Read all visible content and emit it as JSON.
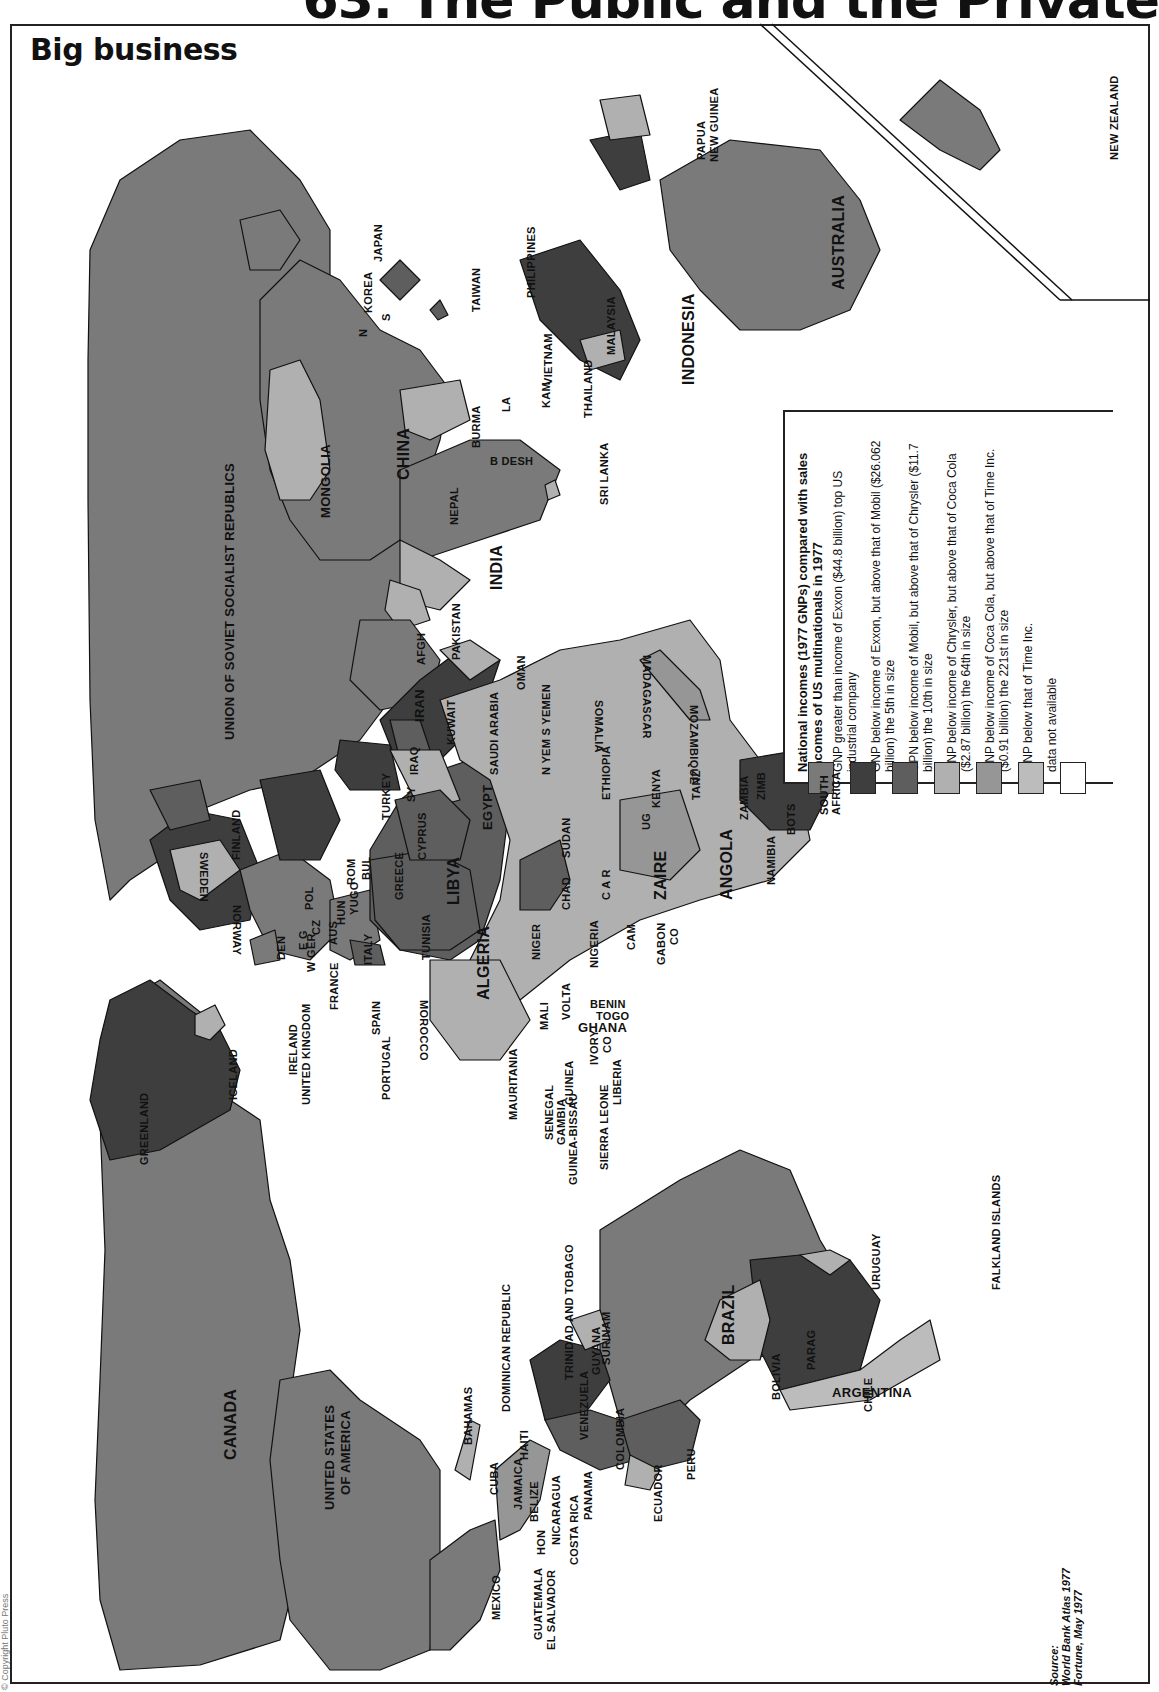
{
  "page": {
    "header_title": "63. The Public and the Private",
    "copyright": "© Copyright Pluto Press"
  },
  "map": {
    "title": "Big business",
    "orientation": "rotated 90° clockwise",
    "colors": {
      "cat1_above_exxon": "#7a7a7a",
      "cat2_exxon_mobil": "#3e3e3e",
      "cat3_mobil_chrysler": "#5e5e5e",
      "cat4_chrysler_cocacola": "#b0b0b0",
      "cat5_cocacola_time": "#969696",
      "cat6_below_time": "#bcbcbc",
      "cat7_no_data": "#ffffff",
      "sea": "#ffffff",
      "border": "#111111"
    }
  },
  "legend": {
    "title": "National incomes (1977 GNPs) compared with sales incomes of US multinationals in 1977",
    "items": [
      {
        "label": "GNP greater than income of Exxon ($44.8 billion) top US industrial company",
        "color": "#7a7a7a"
      },
      {
        "label": "GNP below income of Exxon, but above that of Mobil ($26.062 billion) the 5th in size",
        "color": "#3e3e3e"
      },
      {
        "label": "GPN below income of Mobil, but above that of Chrysler ($11.7 billion) the 10th in size",
        "color": "#5e5e5e"
      },
      {
        "label": "GNP below income of Chrysler, but above that of Coca Cola ($2.87 billion) the 64th in size",
        "color": "#b0b0b0"
      },
      {
        "label": "GNP below income of Coca Cola, but above that of Time Inc. ($0.91 billion) the 221st in size",
        "color": "#969696"
      },
      {
        "label": "GNP below that of Time Inc.",
        "color": "#bcbcbc"
      },
      {
        "label": "data not available",
        "color": "#ffffff"
      }
    ]
  },
  "source": {
    "label": "Source:",
    "lines": [
      "World Bank Atlas 1977",
      "Fortune, May 1977"
    ]
  },
  "labels": {
    "canada": "CANADA",
    "usa1": "UNITED STATES",
    "usa2": "OF AMERICA",
    "mexico": "MEXICO",
    "guatemala": "GUATEMALA",
    "el_salvador": "EL SALVADOR",
    "hon": "HON",
    "belize": "BELIZE",
    "nicaragua": "NICARAGUA",
    "costa_rica": "COSTA RICA",
    "panama": "PANAMA",
    "cuba": "CUBA",
    "jamaica": "JAMAICA",
    "haiti": "HAITI",
    "bahamas": "BAHAMAS",
    "dominican_republic": "DOMINICAN REPUBLIC",
    "trinidad": "TRINIDAD AND TOBAGO",
    "venezuela": "VENEZUELA",
    "colombia": "COLOMBIA",
    "ecuador": "ECUADOR",
    "peru": "PERU",
    "guyana": "GUYANA",
    "surinam": "SURINAM",
    "brazil": "BRAZIL",
    "bolivia": "BOLIVIA",
    "parag": "PARAG",
    "chile": "CHILE",
    "argentina": "ARGENTINA",
    "uruguay": "URUGUAY",
    "falklands": "FALKLAND ISLANDS",
    "greenland": "GREENLAND",
    "iceland": "ICELAND",
    "ireland": "IRELAND",
    "uk": "UNITED KINGDOM",
    "portugal": "PORTUGAL",
    "spain": "SPAIN",
    "france": "FRANCE",
    "italy": "ITALY",
    "w_ger": "W GER",
    "e_ger": "E G",
    "cz": "CZ",
    "aus": "AUS",
    "hun": "HUN",
    "yugo": "YUGO",
    "rom": "ROM",
    "bul": "BUL",
    "pol": "POL",
    "norway": "NORWAY",
    "sweden": "SWEDEN",
    "finland": "FINLAND",
    "den": "DEN",
    "greece": "GREECE",
    "turkey": "TURKEY",
    "cyprus": "CYPRUS",
    "sy": "SY",
    "ussr": "UNION OF SOVIET SOCIALIST REPUBLICS",
    "mongolia": "MONGOLIA",
    "china": "CHINA",
    "korea": "KOREA",
    "korea_n": "N",
    "korea_s": "S",
    "japan": "JAPAN",
    "taiwan": "TAIWAN",
    "philippines": "PHILIPPINES",
    "vietnam": "VIETNAM",
    "kam": "KAM",
    "lao": "LA",
    "thailand": "THAILAND",
    "burma": "BURMA",
    "bdesh": "B DESH",
    "nepal": "NEPAL",
    "india": "INDIA",
    "sri_lanka": "SRI LANKA",
    "pakistan": "PAKISTAN",
    "afgh": "AFGH",
    "iran": "IRAN",
    "iraq": "IRAQ",
    "kuwait": "KUWAIT",
    "saudi": "SAUDI ARABIA",
    "oman": "OMAN",
    "yemen": "N YEM S YEMEN",
    "malaysia": "MALAYSIA",
    "indonesia": "INDONESIA",
    "png1": "PAPUA",
    "png2": "NEW GUINEA",
    "australia": "AUSTRALIA",
    "new_zealand": "NEW ZEALAND",
    "morocco": "MOROCCO",
    "algeria": "ALGERIA",
    "tunisia": "TUNISIA",
    "libya": "LIBYA",
    "egypt": "EGYPT",
    "sudan": "SUDAN",
    "ethiopia": "ETHIOPIA",
    "somalia": "SOMALIA",
    "kenya": "KENYA",
    "ug": "UG",
    "tanz": "TANZ",
    "zaire": "ZAIRE",
    "car": "C A R",
    "chad": "CHAD",
    "niger": "NIGER",
    "nigeria": "NIGERIA",
    "cam": "CAM",
    "gabon": "GABON",
    "co": "CO",
    "mali": "MALI",
    "mauritania": "MAURITANIA",
    "senegal": "SENEGAL",
    "gambia": "GAMBIA",
    "guinea_bissau": "GUINEA-BISSAU",
    "guinea": "GUINEA",
    "sierra_leone": "SIERRA LEONE",
    "liberia": "LIBERIA",
    "ivory": "IVORY",
    "ivory_co": "CO",
    "ghana": "GHANA",
    "volta": "VOLTA",
    "togo": "TOGO",
    "benin": "BENIN",
    "angola": "ANGOLA",
    "zambia": "ZAMBIA",
    "namibia": "NAMIBIA",
    "bots": "BOTS",
    "zimb": "ZIMB",
    "mozambique": "MOZAMBIQUE",
    "madagascar": "MADAGASCAR",
    "south_africa1": "SOUTH",
    "south_africa2": "AFRICA"
  }
}
